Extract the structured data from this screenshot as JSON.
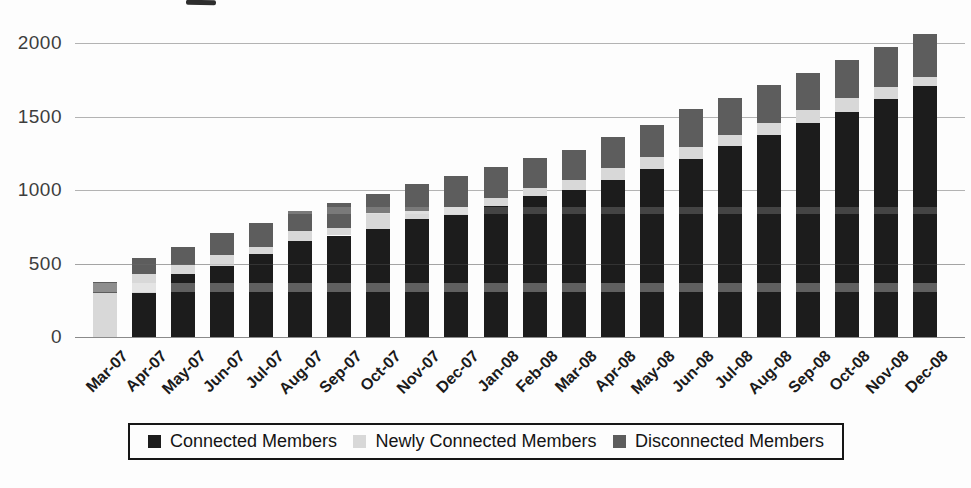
{
  "figure": {
    "background_color": "#fdfdfd",
    "gridline_color": "#a6a6a6",
    "axis_line_color": "#8a8a8a",
    "legend_border_color": "#161616"
  },
  "chart_data": {
    "type": "bar",
    "stacked": true,
    "title": "",
    "xlabel": "",
    "ylabel": "",
    "ylim": [
      0,
      2000
    ],
    "yticks": [
      0,
      500,
      1000,
      1500,
      2000
    ],
    "grid": true,
    "legend_position": "bottom",
    "categories": [
      "Mar-07",
      "Apr-07",
      "May-07",
      "Jun-07",
      "Jul-07",
      "Aug-07",
      "Sep-07",
      "Oct-07",
      "Nov-07",
      "Dec-07",
      "Jan-08",
      "Feb-08",
      "Mar-08",
      "Apr-08",
      "May-08",
      "Jun-08",
      "Jul-08",
      "Aug-08",
      "Sep-08",
      "Oct-08",
      "Nov-08",
      "Dec-08"
    ],
    "series": [
      {
        "name": "Connected Members",
        "color": "#1c1c1c",
        "values": [
          0,
          300,
          430,
          485,
          565,
          650,
          690,
          735,
          800,
          830,
          890,
          960,
          1000,
          1070,
          1145,
          1210,
          1300,
          1375,
          1455,
          1530,
          1620,
          1710
        ]
      },
      {
        "name": "Newly Connected Members",
        "color": "#d8d8d8",
        "values": [
          300,
          130,
          60,
          70,
          50,
          70,
          50,
          110,
          55,
          55,
          55,
          55,
          70,
          80,
          80,
          80,
          75,
          80,
          90,
          95,
          80,
          60
        ]
      },
      {
        "name": "Disconnected Members",
        "color": "#5d5d5d",
        "values": [
          75,
          110,
          120,
          155,
          160,
          140,
          170,
          130,
          185,
          210,
          210,
          205,
          205,
          210,
          220,
          260,
          250,
          260,
          250,
          260,
          270,
          290
        ]
      }
    ],
    "totals": [
      375,
      540,
      610,
      710,
      775,
      860,
      910,
      975,
      1040,
      1095,
      1155,
      1220,
      1275,
      1360,
      1445,
      1550,
      1625,
      1715,
      1795,
      1885,
      1970,
      2060
    ]
  }
}
